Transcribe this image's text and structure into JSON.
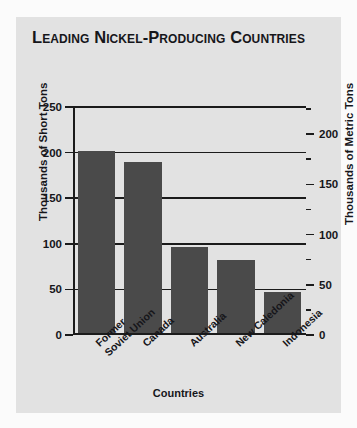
{
  "chart": {
    "title": "Leading Nickel-Producing Countries",
    "panel_bg": "#e2e2e2",
    "bar_color": "#4a4a4a",
    "axis_color": "#1b1b1b"
  },
  "chart_data": {
    "type": "bar",
    "title": "Leading Nickel-Producing Countries",
    "xlabel": "Countries",
    "ylabel": "Thousands of Short Tons",
    "ylabel_right": "Thousands of Metric Tons",
    "categories": [
      "Former\nSoviet Union",
      "Canada",
      "Australia",
      "New Caledonia",
      "Indonesia"
    ],
    "values": [
      200,
      188,
      94,
      80,
      45
    ],
    "ylim": [
      0,
      250
    ],
    "yticks": [
      0,
      50,
      100,
      150,
      200,
      250
    ],
    "ytick_labels": [
      "0",
      "50",
      "100",
      "150",
      "200",
      "250"
    ],
    "ylim_right": [
      0,
      227
    ],
    "yticks_right": [
      0,
      50,
      100,
      150,
      200
    ],
    "ytick_labels_right": [
      "0",
      "50",
      "100",
      "150",
      "200"
    ],
    "yticks_right_minor": [
      25,
      75,
      125,
      175,
      225
    ],
    "grid": true,
    "legend": null
  }
}
